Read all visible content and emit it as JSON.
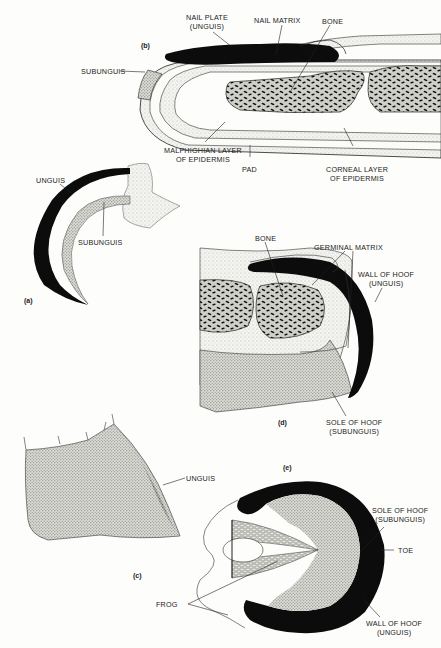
{
  "figure": {
    "panels": [
      {
        "id": "a",
        "tag": "(a)",
        "subject": "claw",
        "labels": [
          "UNGUIS",
          "SUBUNGUIS"
        ]
      },
      {
        "id": "b",
        "tag": "(b)",
        "subject": "nail",
        "labels": [
          "NAIL PLATE (UNGUIS)",
          "NAIL MATRIX",
          "BONE",
          "SUBUNGUIS",
          "MALPHIGHIAN LAYER OF EPIDERMIS",
          "PAD",
          "CORNEAL LAYER OF EPIDERMIS"
        ]
      },
      {
        "id": "c",
        "tag": "(c)",
        "subject": "nail exterior",
        "labels": [
          "UNGUIS"
        ]
      },
      {
        "id": "d",
        "tag": "(d)",
        "subject": "hoof section",
        "labels": [
          "BONE",
          "GERMINAL MATRIX",
          "WALL OF HOOF (UNGUIS)",
          "SOLE OF HOOF (SUBUNGUIS)"
        ]
      },
      {
        "id": "e",
        "tag": "(e)",
        "subject": "hoof underside",
        "labels": [
          "SOLE OF HOOF (SUBUNGUIS)",
          "TOE",
          "FROG",
          "WALL OF HOOF (UNGUIS)"
        ]
      }
    ]
  },
  "tags": {
    "a": "(a)",
    "b": "(b)",
    "c": "(c)",
    "d": "(d)",
    "e": "(e)"
  },
  "b": {
    "nail_plate_1": "NAIL PLATE",
    "nail_plate_2": "(UNGUIS)",
    "nail_matrix": "NAIL MATRIX",
    "bone": "BONE",
    "subunguis": "SUBUNGUIS",
    "malph_1": "MALPHIGHIAN LAYER",
    "malph_2": "OF EPIDERMIS",
    "pad": "PAD",
    "corneal_1": "CORNEAL LAYER",
    "corneal_2": "OF EPIDERMIS"
  },
  "a": {
    "unguis": "UNGUIS",
    "subunguis": "SUBUNGUIS"
  },
  "c": {
    "unguis": "UNGUIS"
  },
  "d": {
    "bone": "BONE",
    "germinal": "GERMINAL MATRIX",
    "wall_1": "WALL OF HOOF",
    "wall_2": "(UNGUIS)",
    "sole_1": "SOLE OF HOOF",
    "sole_2": "(SUBUNGUIS)"
  },
  "e": {
    "sole_1": "SOLE OF HOOF",
    "sole_2": "(SUBUNGUIS)",
    "toe": "TOE",
    "frog": "FROG",
    "wall_1": "WALL OF HOOF",
    "wall_2": "(UNGUIS)"
  }
}
